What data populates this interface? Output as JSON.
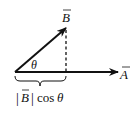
{
  "diagram": {
    "vectors": [
      {
        "name": "B",
        "label": "B",
        "has_arrow_accent": true,
        "from": [
          15,
          72
        ],
        "to": [
          66,
          28
        ]
      },
      {
        "name": "A",
        "label": "A",
        "has_arrow_accent": true,
        "from": [
          15,
          72
        ],
        "to": [
          118,
          72
        ]
      }
    ],
    "angle_label": "θ",
    "projection_label": {
      "abs_open": "|",
      "vector": "B",
      "abs_close": "|",
      "func": "cos",
      "angle": "θ"
    },
    "colors": {
      "stroke": "#111111",
      "background": "#ffffff"
    }
  }
}
